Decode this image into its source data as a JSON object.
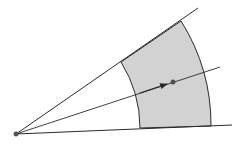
{
  "diagram": {
    "colors": {
      "background": "#ffffff",
      "stroke": "#2a2a2a",
      "fill": "#d2d2d2",
      "point": "#555555"
    },
    "origin": {
      "x": 16,
      "y": 134
    },
    "rays": {
      "upper": {
        "x2": 198,
        "y2": 8
      },
      "lower": {
        "x2": 232,
        "y2": 125
      },
      "middle": {
        "x2": 220,
        "y2": 67
      }
    },
    "sector": {
      "inner_top": {
        "x": 121,
        "y": 62
      },
      "outer_top": {
        "x": 181,
        "y": 21
      },
      "outer_bottom": {
        "x": 211,
        "y": 126
      },
      "inner_bottom": {
        "x": 140,
        "y": 128
      },
      "inner_radius": 125,
      "outer_radius": 195
    },
    "marked_point": {
      "x": 173,
      "y": 82
    },
    "arrow": {
      "from": {
        "x": 16,
        "y": 134
      },
      "to": {
        "x": 167,
        "y": 84
      }
    }
  }
}
